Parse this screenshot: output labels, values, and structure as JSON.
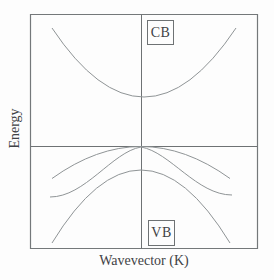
{
  "figure": {
    "y_axis_label": "Energy",
    "x_axis_label": "Wavevector (K)",
    "conduction_band_label": "CB",
    "valence_band_label": "VB"
  },
  "curves": {
    "conduction_band": "M 52,28 Q 144,166 236,28",
    "heavy_hole_band": "M 52,178.5 Q 141,114.5 230,178.5",
    "light_hole_band": "M 50,197 C 85,197 112,152 141,147 C 170,152 197,195 232,195",
    "split_off_band": "M 52,243 Q 141,97 230,243"
  },
  "axes_lines": {
    "frame": "M 30.5,14.5 H 257.5 V 248.5 H 30.5 Z",
    "wavevector_zero_line": "M 141.5,14.5 V 248.5",
    "energy_zero_line": "M 30.5,146.5 H 257.5"
  },
  "colors": {
    "background": "#fdfdfd",
    "frame": "#74787a",
    "axis_line": "#6e7274",
    "curve": "#8f9496",
    "text": "#3f4245"
  }
}
